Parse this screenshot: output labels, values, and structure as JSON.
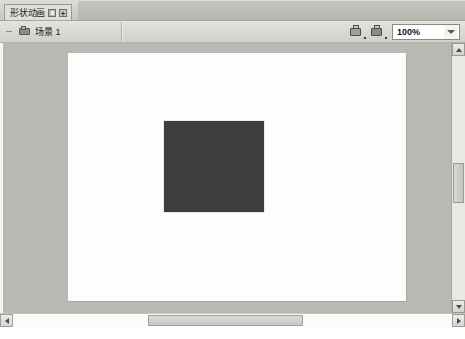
{
  "window": {
    "tab": {
      "label": "形状动画",
      "pin_icon": "pin-icon",
      "close_icon": "close-box-icon"
    }
  },
  "toolbar": {
    "back_icon": "back-arrow-icon",
    "layer_icon": "layer-icon",
    "layer_name": "场景",
    "layer_number": "1",
    "tools": [
      {
        "name": "edit-scene-icon"
      },
      {
        "name": "edit-symbol-icon"
      }
    ],
    "zoom": {
      "value": "100%",
      "dropdown_icon": "chevron-down-icon"
    }
  },
  "canvas": {
    "page_background": "#fdfdfd",
    "workspace_background": "#b9b9b4",
    "shape": {
      "name": "rectangle-shape",
      "fill": "#3d3d3d",
      "stroke": "#e8e8e4"
    }
  },
  "scrollbars": {
    "vertical": {
      "up_icon": "scroll-up-arrow-icon",
      "down_icon": "scroll-down-arrow-icon",
      "thumb": "vertical-scroll-thumb"
    },
    "horizontal": {
      "left_icon": "scroll-left-arrow-icon",
      "right_icon": "scroll-right-arrow-icon",
      "thumb": "horizontal-scroll-thumb"
    }
  }
}
